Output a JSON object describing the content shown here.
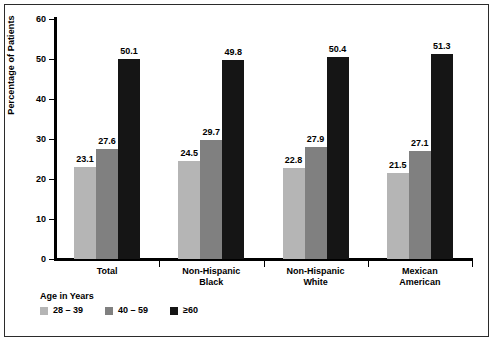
{
  "figure": {
    "background": "#ffffff",
    "frame_color": "#2b2b2b"
  },
  "axis": {
    "y_title": "Percentage of Patients",
    "y_ticks": [
      "0",
      "10",
      "20",
      "30",
      "40",
      "50",
      "60"
    ],
    "zero_label": "0"
  },
  "legend": {
    "title": "Age in Years",
    "items": [
      {
        "label": "28 – 39",
        "color": "#b5b5b5"
      },
      {
        "label": "40 – 59",
        "color": "#808080"
      },
      {
        "label": "≥60",
        "color": "#151515"
      }
    ]
  },
  "chart_data": {
    "type": "bar",
    "title": "",
    "subtitle": "",
    "xlabel": "",
    "ylabel": "Percentage of Patients",
    "ylim": [
      0,
      60
    ],
    "ytick_step": 10,
    "grid": false,
    "legend_position": "bottom-left",
    "legend_title": "Age in Years",
    "categories": [
      "Total",
      "Non-Hispanic Black",
      "Non-Hispanic White",
      "Mexican American"
    ],
    "category_lines": [
      [
        "Total"
      ],
      [
        "Non-Hispanic",
        "Black"
      ],
      [
        "Non-Hispanic",
        "White"
      ],
      [
        "Mexican",
        "American"
      ]
    ],
    "series": [
      {
        "name": "28 – 39",
        "color": "#b5b5b5",
        "values": [
          23.1,
          24.5,
          22.8,
          21.5
        ],
        "labels": [
          "23.1",
          "24.5",
          "22.8",
          "21.5"
        ]
      },
      {
        "name": "40 – 59",
        "color": "#808080",
        "values": [
          27.6,
          29.7,
          27.9,
          27.1
        ],
        "labels": [
          "27.6",
          "29.7",
          "27.9",
          "27.1"
        ]
      },
      {
        "name": "≥60",
        "color": "#151515",
        "values": [
          50.1,
          49.8,
          50.4,
          51.3
        ],
        "labels": [
          "50.1",
          "49.8",
          "50.4",
          "51.3"
        ]
      }
    ]
  }
}
